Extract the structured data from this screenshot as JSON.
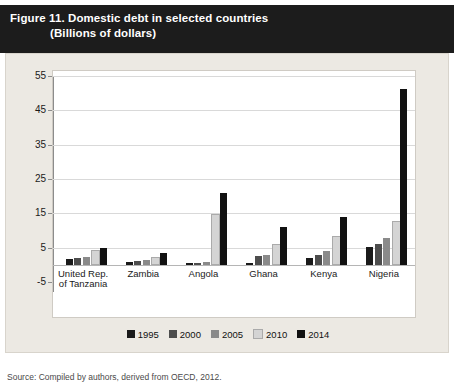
{
  "figure": {
    "title_line1": "Figure 11. Domestic debt in selected countries",
    "title_line2": "(Billions of dollars)",
    "source": "Source: Compiled by authors, derived from OECD, 2012."
  },
  "chart_data": {
    "type": "bar",
    "title": "Figure 11. Domestic debt in selected countries",
    "subtitle": "(Billions of dollars)",
    "xlabel": "",
    "ylabel": "Billions of dollars",
    "ylim": [
      -5,
      55
    ],
    "yticks": [
      -5,
      5,
      15,
      25,
      35,
      45,
      55
    ],
    "grid": true,
    "legend_position": "bottom",
    "categories": [
      "United Rep. of Tanzania",
      "Zambia",
      "Angola",
      "Ghana",
      "Kenya",
      "Nigeria"
    ],
    "series": [
      {
        "name": "1995",
        "color": "#1a1a1a",
        "values": [
          1.6,
          0.9,
          0.4,
          0.5,
          1.9,
          5.2
        ]
      },
      {
        "name": "2000",
        "color": "#4d4d4d",
        "values": [
          1.9,
          1.1,
          0.5,
          2.5,
          3.0,
          6.1
        ]
      },
      {
        "name": "2005",
        "color": "#8a8a8a",
        "values": [
          2.3,
          1.4,
          0.7,
          3.0,
          4.1,
          7.9
        ]
      },
      {
        "name": "2010",
        "color": "#d4d4d4",
        "values": [
          3.6,
          1.6,
          14.2,
          5.6,
          7.7,
          12.3
        ]
      },
      {
        "name": "2014",
        "color": "#111111",
        "values": [
          5.0,
          3.5,
          21.0,
          11.1,
          13.8,
          51.3
        ]
      }
    ],
    "legend": [
      "1995",
      "2000",
      "2005",
      "2010",
      "2014"
    ]
  }
}
